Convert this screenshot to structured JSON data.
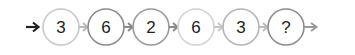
{
  "sequence": {
    "nodes": [
      {
        "label": "3",
        "stroke": "#c8c8c8"
      },
      {
        "label": "6",
        "stroke": "#8a8a8a"
      },
      {
        "label": "2",
        "stroke": "#9a9a9a"
      },
      {
        "label": "6",
        "stroke": "#d2d2d2"
      },
      {
        "label": "3",
        "stroke": "#b4b4b4"
      },
      {
        "label": "?",
        "stroke": "#8c8c8c"
      }
    ],
    "start_arrow_color": "#222222",
    "connector_colors": [
      "#bbbbbb",
      "#8a8a8a",
      "#c8c8c8",
      "#c8c8c8",
      "#bbbbbb",
      "#9a9a9a"
    ]
  }
}
